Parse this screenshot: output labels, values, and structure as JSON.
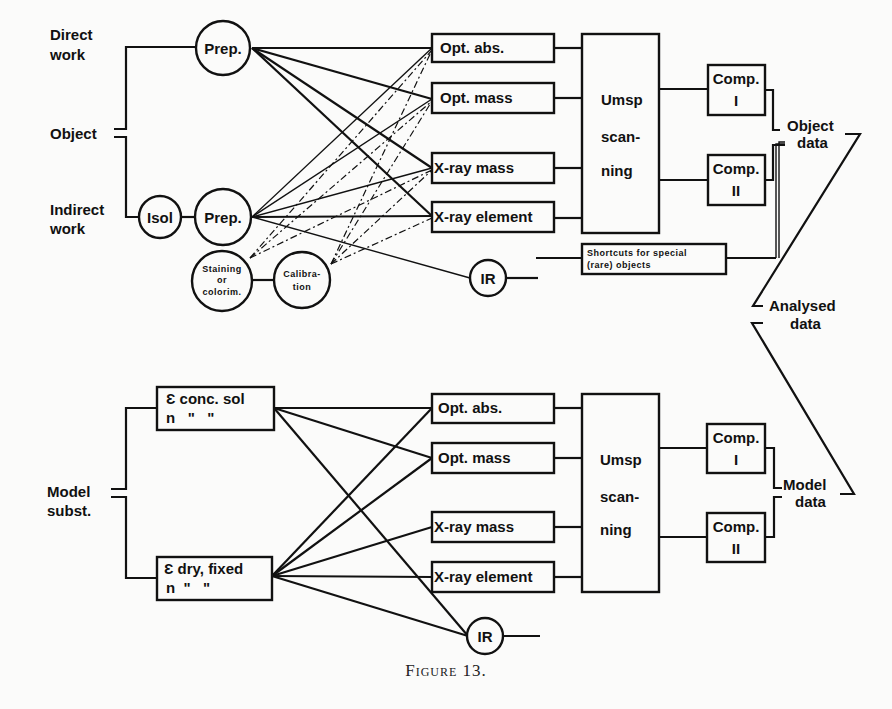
{
  "figure": {
    "caption": "Figure 13."
  },
  "top": {
    "inputs": {
      "direct_work": [
        "Direct",
        "work"
      ],
      "object": "Object",
      "indirect_work": [
        "Indirect",
        "work"
      ]
    },
    "nodes": {
      "prep_direct": "Prep.",
      "isol": "Isol",
      "prep_indirect": "Prep.",
      "staining": [
        "Staining",
        "or",
        "colorim."
      ],
      "calibration": [
        "Calibra-",
        "tion"
      ],
      "ir": "IR"
    },
    "methods": [
      "Opt. abs.",
      "Opt. mass",
      "X-ray mass",
      "X-ray element"
    ],
    "scanner": [
      "Umsp",
      "scan-",
      "ning"
    ],
    "computers": [
      [
        "Comp.",
        "I"
      ],
      [
        "Comp.",
        "II"
      ]
    ],
    "shortcut": [
      "Shortcuts for special",
      "(rare) objects"
    ],
    "output": [
      "Object",
      "data"
    ]
  },
  "middle": {
    "analysed": [
      "Analysed",
      "data"
    ]
  },
  "bottom": {
    "input": [
      "Model",
      "subst."
    ],
    "sources": [
      {
        "line1": "Ɛ conc. sol",
        "line2": "n   \"   \""
      },
      {
        "line1": "Ɛ dry, fixed",
        "line2": "n  \"   \""
      }
    ],
    "methods": [
      "Opt. abs.",
      "Opt. mass",
      "X-ray mass",
      "X-ray element"
    ],
    "ir": "IR",
    "scanner": [
      "Umsp",
      "scan-",
      "ning"
    ],
    "computers": [
      [
        "Comp.",
        "I"
      ],
      [
        "Comp.",
        "II"
      ]
    ],
    "output": [
      "Model",
      "data"
    ]
  }
}
